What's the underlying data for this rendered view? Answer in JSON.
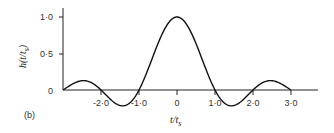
{
  "panel_label": "(b)",
  "chart_data": {
    "type": "line",
    "title": "",
    "xlabel": "t/t_s",
    "ylabel": "h(t/t_s)",
    "xlim": [
      -3.0,
      3.7
    ],
    "ylim": [
      -0.25,
      1.05
    ],
    "x_ticks": [
      -2.0,
      -1.0,
      0,
      1.0,
      2.0,
      3.0
    ],
    "x_tick_labels": [
      "-2·0",
      "-1·0",
      "0",
      "1·0",
      "2·0",
      "3·0"
    ],
    "y_ticks": [
      0,
      0.5,
      1.0
    ],
    "y_tick_labels": [
      "0",
      "0·5",
      "1·0"
    ],
    "grid": false,
    "legend": null,
    "series": [
      {
        "name": "h(t/t_s) = sinc(t/t_s)",
        "x": [
          -3.0,
          -2.75,
          -2.5,
          -2.25,
          -2.0,
          -1.75,
          -1.5,
          -1.43,
          -1.25,
          -1.0,
          -0.75,
          -0.5,
          -0.25,
          0,
          0.25,
          0.5,
          0.75,
          1.0,
          1.25,
          1.43,
          1.5,
          1.75,
          2.0,
          2.25,
          2.5,
          2.75,
          3.0
        ],
        "y": [
          0.0,
          0.082,
          0.127,
          0.1,
          0.0,
          -0.129,
          -0.212,
          -0.217,
          -0.18,
          0.0,
          0.3,
          0.637,
          0.9,
          1.0,
          0.9,
          0.637,
          0.3,
          0.0,
          -0.18,
          -0.217,
          -0.212,
          -0.129,
          0.0,
          0.1,
          0.127,
          0.082,
          0.0
        ]
      }
    ]
  },
  "labels": {
    "y_ticks": [
      "1·0",
      "0·5",
      "0"
    ],
    "x_ticks": [
      "-2·0",
      "-1·0",
      "0",
      "1·0",
      "2·0",
      "3·0"
    ],
    "xlabel_main": "t/t",
    "xlabel_sub": "s",
    "ylabel_main": "h(t/t",
    "ylabel_sub": "s",
    "ylabel_close": ")"
  }
}
